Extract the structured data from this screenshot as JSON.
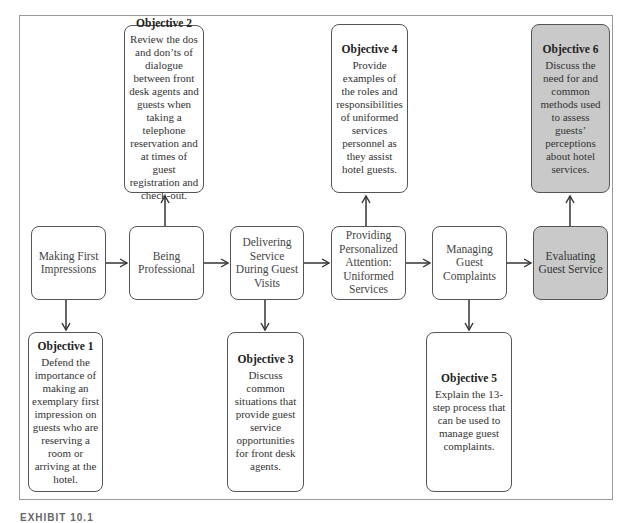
{
  "diagram": {
    "stages": [
      {
        "id": "s1",
        "label": "Making First Impressions",
        "highlight": false
      },
      {
        "id": "s2",
        "label": "Being Professional",
        "highlight": false
      },
      {
        "id": "s3",
        "label": "Delivering Service During Guest Visits",
        "highlight": false
      },
      {
        "id": "s4",
        "label": "Providing Personalized Attention: Uniformed Services",
        "highlight": false
      },
      {
        "id": "s5",
        "label": "Managing Guest Complaints",
        "highlight": false
      },
      {
        "id": "s6",
        "label": "Evaluating Guest Service",
        "highlight": true
      }
    ],
    "objectives": [
      {
        "id": "o1",
        "title": "Objective 1",
        "text": "Defend the importance of making an exemplary first impression on guests who are reserving a room or arriving at the hotel.",
        "attached_to": "s1",
        "position": "below"
      },
      {
        "id": "o2",
        "title": "Objective 2",
        "text": "Review the dos and don’ts of dialogue between front desk agents and guests when taking a telephone reservation and at times of guest registration and check-out.",
        "attached_to": "s2",
        "position": "above"
      },
      {
        "id": "o3",
        "title": "Objective 3",
        "text": "Discuss common situations that provide guest service opportunities for front desk agents.",
        "attached_to": "s3",
        "position": "below"
      },
      {
        "id": "o4",
        "title": "Objective 4",
        "text": "Provide examples of the roles and responsibilities of uniformed services personnel as they assist hotel guests.",
        "attached_to": "s4",
        "position": "above"
      },
      {
        "id": "o5",
        "title": "Objective 5",
        "text": "Explain the 13-step process that can be used to manage guest complaints.",
        "attached_to": "s5",
        "position": "below"
      },
      {
        "id": "o6",
        "title": "Objective 6",
        "text": "Discuss the need for and common methods used to assess guests’ perceptions about hotel services.",
        "attached_to": "s6",
        "position": "above",
        "highlight": true
      }
    ],
    "colors": {
      "highlight_fill": "#c9c9c9",
      "box_border": "#555555",
      "frame_border": "#9a9a9a",
      "arrow": "#333333"
    }
  },
  "caption": {
    "label": "EXHIBIT 10.1"
  }
}
